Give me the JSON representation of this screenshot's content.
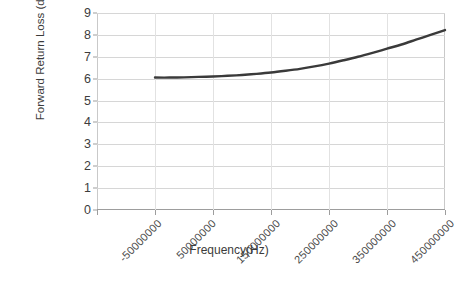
{
  "chart_data": {
    "type": "line",
    "title": "",
    "xlabel": "Frequency(Hz)",
    "ylabel": "Forward Return Loss (dB)",
    "xlim": [
      -50000000,
      550000000
    ],
    "ylim": [
      0,
      9
    ],
    "y_ticks": [
      0,
      1,
      2,
      3,
      4,
      5,
      6,
      7,
      8,
      9
    ],
    "x_ticks": [
      -50000000,
      50000000,
      150000000,
      250000000,
      350000000,
      450000000,
      550000000
    ],
    "x_tick_labels": [
      "-50000000",
      "50000000",
      "150000000",
      "250000000",
      "350000000",
      "450000000",
      "550000000"
    ],
    "y_tick_labels": [
      "0",
      "1",
      "2",
      "3",
      "4",
      "5",
      "6",
      "7",
      "8",
      "9"
    ],
    "grid": true,
    "grid_axis": "y",
    "legend": false,
    "legend_position": "none",
    "series": [
      {
        "name": "Forward Return Loss",
        "color": "#3a3a3a",
        "line_width": 2.4,
        "x": [
          50000000,
          75000000,
          100000000,
          125000000,
          150000000,
          175000000,
          200000000,
          225000000,
          250000000,
          275000000,
          300000000,
          325000000,
          350000000,
          375000000,
          400000000,
          425000000,
          450000000,
          475000000,
          500000000,
          525000000,
          550000000
        ],
        "values": [
          6.05,
          6.05,
          6.06,
          6.08,
          6.1,
          6.13,
          6.17,
          6.22,
          6.28,
          6.36,
          6.45,
          6.56,
          6.69,
          6.84,
          7.0,
          7.18,
          7.37,
          7.56,
          7.78,
          8.0,
          8.22
        ]
      }
    ]
  },
  "axes": {
    "y_title": "Forward Return Loss (dB)",
    "x_title": "Frequency(Hz)"
  }
}
